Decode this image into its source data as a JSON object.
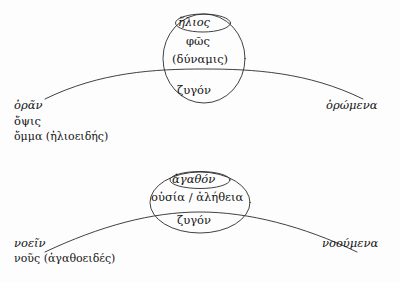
{
  "figure": {
    "stroke_color": "#2b2b2b",
    "background_color": "#fdfdfd"
  },
  "upper": {
    "core_name": "ἥλιος",
    "core_second": "φῶς",
    "core_third": "(δύναμις)",
    "yoke": "ζυγόν",
    "left": {
      "line1": "ὁρᾶν",
      "line2": "ὄψις",
      "line3": "ὄμμα (ἡλιοειδής)"
    },
    "right": {
      "line1": "ὁρώμενα"
    }
  },
  "lower": {
    "core_name": "ἀγαθόν",
    "core_second": "οὐσία / ἀλήθεια",
    "yoke": "ζυγόν",
    "left": {
      "line1": "νοεῖν",
      "line2": "νοῦς (ἀγαθοειδές)"
    },
    "right": {
      "line1": "νοούμενα"
    }
  }
}
